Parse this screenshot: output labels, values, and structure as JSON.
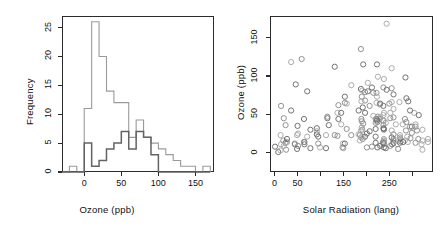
{
  "figure": {
    "background": "#ffffff",
    "frame_color": "#2b2b2b",
    "panels": [
      "histogram",
      "scatter"
    ]
  },
  "chart_data": [
    {
      "type": "bar",
      "subtype": "histogram-overlay",
      "panel": "left",
      "title": "",
      "xlabel": "Ozone (ppb)",
      "ylabel": "Frequency",
      "xlim": [
        -30,
        175
      ],
      "ylim": [
        0,
        27
      ],
      "xticks": [
        0,
        50,
        100,
        150
      ],
      "xtick_labels": [
        "0",
        "50",
        "100",
        "150"
      ],
      "yticks": [
        0,
        5,
        10,
        15,
        20,
        25
      ],
      "ytick_labels": [
        "0",
        "5",
        "10",
        "15",
        "20",
        "25"
      ],
      "grid": false,
      "legend": "none",
      "bin_width": 10,
      "series": [
        {
          "name": "light",
          "color": "#9a9a9a",
          "bin_starts": [
            -30,
            -20,
            -10,
            0,
            10,
            20,
            30,
            40,
            50,
            60,
            70,
            80,
            90,
            100,
            110,
            120,
            130,
            140,
            150,
            160
          ],
          "values": [
            0,
            1,
            0,
            11,
            26,
            20,
            14,
            12,
            12,
            6,
            9,
            6,
            5,
            4,
            3,
            2,
            1,
            1,
            0,
            1
          ]
        },
        {
          "name": "dark",
          "color": "#636363",
          "bin_starts": [
            -30,
            -20,
            -10,
            0,
            10,
            20,
            30,
            40,
            50,
            60,
            70,
            80,
            90,
            100,
            110,
            120,
            130,
            140,
            150,
            160
          ],
          "values": [
            0,
            0,
            0,
            5,
            1,
            2,
            4,
            5,
            7,
            4,
            7,
            6,
            3,
            0,
            0,
            0,
            0,
            0,
            0,
            0
          ]
        }
      ]
    },
    {
      "type": "scatter",
      "panel": "right",
      "title": "",
      "xlabel": "Solar Radiation (lang)",
      "ylabel": "Ozone (ppb)",
      "xlim": [
        -10,
        345
      ],
      "ylim": [
        -25,
        178
      ],
      "xticks": [
        0,
        50,
        100,
        150,
        200,
        250,
        300
      ],
      "xtick_labels": [
        "0",
        "50",
        "",
        "150",
        "",
        "250",
        ""
      ],
      "yticks": [
        0,
        50,
        100,
        150
      ],
      "ytick_labels": [
        "0",
        "50",
        "100",
        "150"
      ],
      "grid": false,
      "legend": "none",
      "marker": "open-circle",
      "marker_colors": [
        "#8c8c8c",
        "#6b6b6b",
        "#a8a8a8"
      ],
      "points": [
        [
          190,
          41
        ],
        [
          118,
          36
        ],
        [
          149,
          12
        ],
        [
          313,
          18
        ],
        [
          299,
          34
        ],
        [
          99,
          7
        ],
        [
          19,
          16
        ],
        [
          256,
          11
        ],
        [
          290,
          14
        ],
        [
          274,
          18
        ],
        [
          65,
          11
        ],
        [
          334,
          14
        ],
        [
          307,
          34
        ],
        [
          78,
          6
        ],
        [
          322,
          30
        ],
        [
          44,
          11
        ],
        [
          8,
          1
        ],
        [
          320,
          11
        ],
        [
          25,
          4
        ],
        [
          92,
          32
        ],
        [
          13,
          23
        ],
        [
          252,
          45
        ],
        [
          223,
          115
        ],
        [
          279,
          37
        ],
        [
          286,
          29
        ],
        [
          287,
          71
        ],
        [
          242,
          39
        ],
        [
          186,
          23
        ],
        [
          220,
          21
        ],
        [
          264,
          37
        ],
        [
          273,
          20
        ],
        [
          238,
          12
        ],
        [
          13,
          3
        ],
        [
          295,
          34
        ],
        [
          1,
          8
        ],
        [
          259,
          24
        ],
        [
          250,
          64
        ],
        [
          230,
          9
        ],
        [
          259,
          16
        ],
        [
          222,
          78
        ],
        [
          50,
          35
        ],
        [
          255,
          66
        ],
        [
          59,
          122
        ],
        [
          46,
          89
        ],
        [
          255,
          110
        ],
        [
          229,
          44
        ],
        [
          207,
          28
        ],
        [
          222,
          65
        ],
        [
          137,
          22
        ],
        [
          192,
          59
        ],
        [
          273,
          23
        ],
        [
          157,
          31
        ],
        [
          64,
          44
        ],
        [
          71,
          21
        ],
        [
          51,
          9
        ],
        [
          115,
          45
        ],
        [
          244,
          168
        ],
        [
          190,
          73
        ],
        [
          259,
          76
        ],
        [
          36,
          118
        ],
        [
          255,
          84
        ],
        [
          212,
          85
        ],
        [
          238,
          96
        ],
        [
          215,
          78
        ],
        [
          153,
          73
        ],
        [
          203,
          91
        ],
        [
          225,
          47
        ],
        [
          237,
          32
        ],
        [
          188,
          20
        ],
        [
          167,
          23
        ],
        [
          197,
          21
        ],
        [
          183,
          24
        ],
        [
          189,
          44
        ],
        [
          95,
          21
        ],
        [
          92,
          28
        ],
        [
          252,
          9
        ],
        [
          220,
          13
        ],
        [
          230,
          46
        ],
        [
          259,
          18
        ],
        [
          236,
          13
        ],
        [
          259,
          24
        ],
        [
          238,
          16
        ],
        [
          24,
          13
        ],
        [
          112,
          23
        ],
        [
          237,
          36
        ],
        [
          224,
          7
        ],
        [
          27,
          14
        ],
        [
          238,
          30
        ],
        [
          201,
          25
        ],
        [
          238,
          52
        ],
        [
          14,
          61
        ],
        [
          139,
          44
        ],
        [
          49,
          23
        ],
        [
          20,
          45
        ],
        [
          193,
          115
        ],
        [
          145,
          37
        ],
        [
          191,
          30
        ],
        [
          131,
          112
        ],
        [
          223,
          73
        ],
        [
          188,
          135
        ],
        [
          237,
          61
        ],
        [
          220,
          44
        ],
        [
          284,
          44
        ],
        [
          197,
          52
        ],
        [
          289,
          21
        ],
        [
          274,
          15
        ],
        [
          65,
          14
        ],
        [
          334,
          18
        ],
        [
          307,
          13
        ],
        [
          78,
          30
        ],
        [
          322,
          4
        ],
        [
          44,
          12
        ],
        [
          255,
          20
        ],
        [
          229,
          63
        ],
        [
          207,
          61
        ],
        [
          222,
          44
        ],
        [
          137,
          52
        ],
        [
          192,
          18
        ],
        [
          273,
          13
        ],
        [
          157,
          64
        ],
        [
          64,
          14
        ],
        [
          71,
          80
        ],
        [
          51,
          25
        ],
        [
          115,
          47
        ],
        [
          244,
          82
        ],
        [
          190,
          33
        ],
        [
          259,
          46
        ],
        [
          36,
          55
        ],
        [
          255,
          29
        ],
        [
          212,
          8
        ],
        [
          238,
          7
        ],
        [
          215,
          48
        ],
        [
          153,
          65
        ],
        [
          203,
          80
        ],
        [
          225,
          99
        ],
        [
          237,
          85
        ],
        [
          188,
          83
        ],
        [
          167,
          88
        ],
        [
          197,
          68
        ],
        [
          183,
          55
        ],
        [
          189,
          67
        ],
        [
          95,
          12
        ],
        [
          92,
          24
        ],
        [
          252,
          52
        ],
        [
          220,
          39
        ],
        [
          230,
          64
        ],
        [
          259,
          57
        ],
        [
          236,
          42
        ],
        [
          259,
          13
        ],
        [
          238,
          18
        ],
        [
          24,
          36
        ],
        [
          112,
          6
        ],
        [
          237,
          49
        ],
        [
          224,
          40
        ],
        [
          27,
          18
        ],
        [
          238,
          42
        ],
        [
          201,
          7
        ],
        [
          238,
          31
        ],
        [
          14,
          11
        ],
        [
          139,
          62
        ],
        [
          49,
          5
        ],
        [
          20,
          9
        ],
        [
          193,
          38
        ],
        [
          145,
          52
        ],
        [
          191,
          81
        ],
        [
          131,
          23
        ],
        [
          223,
          42
        ],
        [
          188,
          29
        ],
        [
          237,
          14
        ],
        [
          220,
          31
        ],
        [
          284,
          16
        ],
        [
          197,
          79
        ],
        [
          291,
          67
        ],
        [
          304,
          52
        ],
        [
          287,
          40
        ],
        [
          280,
          14
        ],
        [
          268,
          11
        ],
        [
          296,
          19
        ],
        [
          314,
          49
        ],
        [
          307,
          37
        ],
        [
          299,
          26
        ],
        [
          285,
          98
        ],
        [
          272,
          66
        ],
        [
          310,
          29
        ],
        [
          295,
          55
        ],
        [
          322,
          16
        ],
        [
          269,
          5
        ],
        [
          242,
          6
        ],
        [
          150,
          6
        ],
        [
          148,
          7
        ],
        [
          153,
          12
        ],
        [
          186,
          16
        ]
      ]
    }
  ],
  "labels": {
    "hist_xlabel": "Ozone (ppb)",
    "hist_ylabel": "Frequency",
    "scatter_xlabel": "Solar Radiation (lang)",
    "scatter_ylabel": "Ozone (ppb)"
  }
}
